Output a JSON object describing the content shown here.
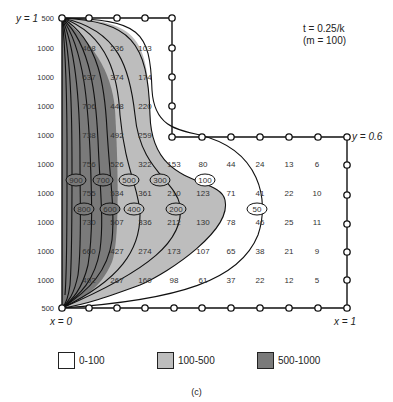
{
  "annotation": {
    "time": "t = 0.25/k",
    "param": "(m = 100)"
  },
  "boundary_labels": {
    "top_left": "y = 1",
    "step": "y = 0.6",
    "bottom_left": "x = 0",
    "bottom_right": "x = 1"
  },
  "left_edge_values": [
    "500",
    "1000",
    "1000",
    "1000",
    "1000",
    "1000",
    "1000",
    "1000",
    "1000",
    "1000",
    "500"
  ],
  "grid_rows": [
    [
      "468",
      "236",
      "103"
    ],
    [
      "637",
      "374",
      "174"
    ],
    [
      "706",
      "448",
      "220"
    ],
    [
      "738",
      "492",
      "259"
    ],
    [
      "756",
      "526",
      "322",
      "153",
      "80",
      "44",
      "24",
      "13",
      "6"
    ],
    [
      "755",
      "534",
      "361",
      "210",
      "123",
      "71",
      "41",
      "22",
      "10"
    ],
    [
      "730",
      "507",
      "336",
      "212",
      "130",
      "78",
      "46",
      "25",
      "11"
    ],
    [
      "660",
      "427",
      "274",
      "173",
      "107",
      "65",
      "38",
      "21",
      "9"
    ],
    [
      "492",
      "267",
      "160",
      "98",
      "61",
      "37",
      "22",
      "12",
      "5"
    ]
  ],
  "contour_labels": [
    "900",
    "700",
    "500",
    "300",
    "100",
    "800",
    "600",
    "400",
    "200",
    "50"
  ],
  "legend": [
    {
      "label": "0-100",
      "color": "#ffffff"
    },
    {
      "label": "100-500",
      "color": "#bdbdbd"
    },
    {
      "label": "500-1000",
      "color": "#7a7a7a"
    }
  ],
  "caption": "(c)"
}
